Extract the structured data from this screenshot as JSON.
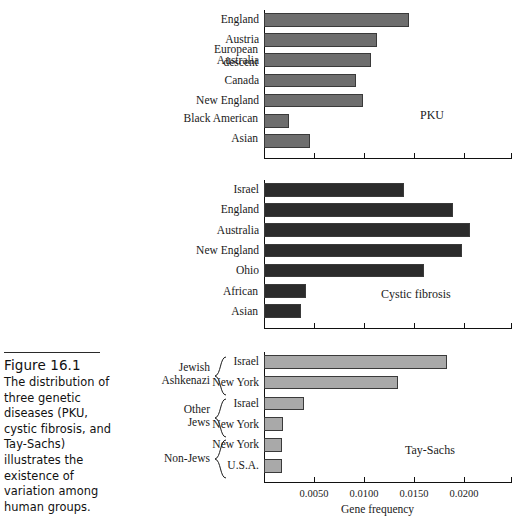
{
  "figure": {
    "number": "Figure 16.1",
    "caption": "The distribution of three genetic diseases (PKU, cystic fibrosis, and Tay-Sachs) illustrates the existence of variation among human groups."
  },
  "axis": {
    "title": "Gene frequency",
    "tick_labels": [
      "0.0050",
      "0.0100",
      "0.0150",
      "0.0200"
    ],
    "tick_values": [
      0.005,
      0.01,
      0.015,
      0.02
    ],
    "min": 0,
    "max": 0.0248
  },
  "colors": {
    "pku_bar": "#6e6e6e",
    "cf_bar": "#2b2b2b",
    "tay_bar": "#a9a9a9",
    "bar_outline": "#3a3a3a",
    "axis": "#111111",
    "text": "#1a1a1a"
  },
  "chart_data": [
    {
      "type": "bar",
      "orientation": "horizontal",
      "title": "PKU",
      "xlabel": "Gene frequency",
      "ylabel": "",
      "xlim": [
        0,
        0.0248
      ],
      "grid": false,
      "legend": "none",
      "bar_color": "#6e6e6e",
      "categories": [
        "England",
        "Austria",
        "Australia",
        "Canada",
        "New England",
        "Black American",
        "Asian"
      ],
      "values": [
        0.0145,
        0.0113,
        0.0107,
        0.0092,
        0.0099,
        0.0025,
        0.0046
      ],
      "group_labels": [
        {
          "text": "European descent",
          "covers": [
            "England",
            "Austria",
            "Australia",
            "Canada",
            "New England"
          ],
          "brace": false
        },
        {
          "text": "Black American",
          "covers": [
            "Black American"
          ],
          "brace": false
        },
        {
          "text": "Asian",
          "covers": [
            "Asian"
          ],
          "brace": false
        }
      ]
    },
    {
      "type": "bar",
      "orientation": "horizontal",
      "title": "Cystic fibrosis",
      "xlabel": "Gene frequency",
      "ylabel": "",
      "xlim": [
        0,
        0.0248
      ],
      "grid": false,
      "legend": "none",
      "bar_color": "#2b2b2b",
      "categories": [
        "Israel",
        "England",
        "Australia",
        "New England",
        "Ohio",
        "African",
        "Asian"
      ],
      "values": [
        0.014,
        0.0189,
        0.0206,
        0.0198,
        0.016,
        0.0042,
        0.0037
      ],
      "group_labels": [
        {
          "text": "African",
          "covers": [
            "African"
          ],
          "brace": false
        },
        {
          "text": "Asian",
          "covers": [
            "Asian"
          ],
          "brace": false
        }
      ]
    },
    {
      "type": "bar",
      "orientation": "horizontal",
      "title": "Tay-Sachs",
      "xlabel": "Gene frequency",
      "ylabel": "",
      "xlim": [
        0,
        0.0248
      ],
      "grid": false,
      "legend": "none",
      "bar_color": "#a9a9a9",
      "categories": [
        "Israel",
        "New York",
        "Israel",
        "New York",
        "New York",
        "U.S.A."
      ],
      "values": [
        0.0183,
        0.0134,
        0.004,
        0.0019,
        0.0018,
        0.0018
      ],
      "group_labels": [
        {
          "text": "Jewish Ashkenazi",
          "covers": [
            "Israel",
            "New York"
          ],
          "brace": true
        },
        {
          "text": "Other Jews",
          "covers": [
            "Israel",
            "New York"
          ],
          "brace": true
        },
        {
          "text": "Non-Jews",
          "covers": [
            "New York",
            "U.S.A."
          ],
          "brace": true
        }
      ]
    }
  ],
  "panels": {
    "pku": {
      "disease_label": "PKU",
      "group_top_line": "European",
      "group_bottom_line": "descent",
      "group_black": "Black American",
      "group_asian": "Asian",
      "rows": [
        {
          "label": "England",
          "value": 0.0145
        },
        {
          "label": "Austria",
          "value": 0.0113
        },
        {
          "label": "Australia",
          "value": 0.0107
        },
        {
          "label": "Canada",
          "value": 0.0092
        },
        {
          "label": "New England",
          "value": 0.0099
        },
        {
          "label": "",
          "value": 0.0025
        },
        {
          "label": "",
          "value": 0.0046
        }
      ]
    },
    "cf": {
      "disease_label": "Cystic fibrosis",
      "group_african": "African",
      "group_asian": "Asian",
      "rows": [
        {
          "label": "Israel",
          "value": 0.014
        },
        {
          "label": "England",
          "value": 0.0189
        },
        {
          "label": "Australia",
          "value": 0.0206
        },
        {
          "label": "New England",
          "value": 0.0198
        },
        {
          "label": "Ohio",
          "value": 0.016
        },
        {
          "label": "",
          "value": 0.0042
        },
        {
          "label": "",
          "value": 0.0037
        }
      ]
    },
    "tay": {
      "disease_label": "Tay-Sachs",
      "group_jewish_line1": "Jewish",
      "group_jewish_line2": "Ashkenazi",
      "group_other_line1": "Other",
      "group_other_line2": "Jews",
      "group_nonjews": "Non-Jews",
      "rows": [
        {
          "label": "Israel",
          "value": 0.0183
        },
        {
          "label": "New York",
          "value": 0.0134
        },
        {
          "label": "Israel",
          "value": 0.004
        },
        {
          "label": "New York",
          "value": 0.0019
        },
        {
          "label": "New York",
          "value": 0.0018
        },
        {
          "label": "U.S.A.",
          "value": 0.0018
        }
      ]
    }
  }
}
